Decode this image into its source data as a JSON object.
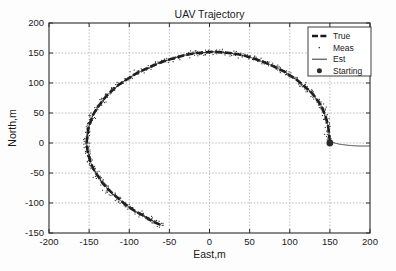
{
  "chart_data": {
    "type": "line",
    "title": "UAV Trajectory",
    "xlabel": "East,m",
    "ylabel": "North,m",
    "xlim": [
      -200,
      200
    ],
    "ylim": [
      -150,
      200
    ],
    "xticks": [
      -200,
      -150,
      -100,
      -50,
      0,
      50,
      100,
      150,
      200
    ],
    "yticks": [
      -150,
      -100,
      -50,
      0,
      50,
      100,
      150,
      200
    ],
    "grid": true,
    "legend_position": "top-right",
    "legend": [
      {
        "name": "True",
        "style": "dashed-thick",
        "color": "#1a1a1a"
      },
      {
        "name": "Meas",
        "style": "dot-marker",
        "color": "#3a3a3a"
      },
      {
        "name": "Est",
        "style": "solid-thin",
        "color": "#1a1a1a"
      },
      {
        "name": "Starting",
        "style": "filled-circle",
        "color": "#2a2a2a"
      }
    ],
    "annotations": [
      {
        "label": "Starting",
        "x": 150,
        "y": 0
      }
    ],
    "series": [
      {
        "name": "True",
        "style": "dashed-thick",
        "comment": "Circular arc radius ~152 centered near (0,0); traversed counter-clockwise from (150,0) over the top, around the left side, then a descending tail to (-60,-137)",
        "points": [
          [
            150,
            2
          ],
          [
            149,
            14
          ],
          [
            148,
            26
          ],
          [
            146,
            38
          ],
          [
            143,
            50
          ],
          [
            139,
            62
          ],
          [
            134,
            72
          ],
          [
            129,
            81
          ],
          [
            123,
            89
          ],
          [
            116,
            97
          ],
          [
            109,
            105
          ],
          [
            101,
            112
          ],
          [
            93,
            119
          ],
          [
            84,
            125
          ],
          [
            75,
            131
          ],
          [
            65,
            136
          ],
          [
            55,
            141
          ],
          [
            45,
            145
          ],
          [
            35,
            148
          ],
          [
            25,
            150
          ],
          [
            15,
            151
          ],
          [
            5,
            152
          ],
          [
            -5,
            151
          ],
          [
            -15,
            150
          ],
          [
            -25,
            148
          ],
          [
            -35,
            145
          ],
          [
            -45,
            141
          ],
          [
            -55,
            137
          ],
          [
            -65,
            132
          ],
          [
            -75,
            126
          ],
          [
            -85,
            120
          ],
          [
            -95,
            113
          ],
          [
            -104,
            105
          ],
          [
            -113,
            97
          ],
          [
            -121,
            88
          ],
          [
            -128,
            79
          ],
          [
            -134,
            69
          ],
          [
            -140,
            58
          ],
          [
            -145,
            47
          ],
          [
            -148,
            36
          ],
          [
            -151,
            24
          ],
          [
            -152,
            12
          ],
          [
            -153,
            0
          ],
          [
            -152,
            -12
          ],
          [
            -150,
            -24
          ],
          [
            -147,
            -36
          ],
          [
            -143,
            -47
          ],
          [
            -138,
            -57
          ],
          [
            -133,
            -67
          ],
          [
            -127,
            -76
          ],
          [
            -120,
            -85
          ],
          [
            -113,
            -93
          ],
          [
            -106,
            -101
          ],
          [
            -99,
            -108
          ],
          [
            -92,
            -114
          ],
          [
            -85,
            -119
          ],
          [
            -79,
            -124
          ],
          [
            -73,
            -129
          ],
          [
            -67,
            -133
          ],
          [
            -60,
            -137
          ]
        ]
      },
      {
        "name": "Est",
        "style": "solid-thin",
        "comment": "Estimated track overlays the true arc, then diverges to the right of the starting point toward (200,-5)",
        "points": [
          [
            150,
            2
          ],
          [
            156,
            0
          ],
          [
            162,
            -2
          ],
          [
            168,
            -3
          ],
          [
            174,
            -4
          ],
          [
            180,
            -4.5
          ],
          [
            186,
            -5
          ],
          [
            193,
            -5
          ],
          [
            200,
            -5
          ]
        ]
      },
      {
        "name": "Meas",
        "style": "dot-marker",
        "comment": "Noisy measurements scattered +/- 4 m about the True arc along its whole length",
        "noise_sigma": 4
      }
    ]
  },
  "axes": {
    "x_tick_labels": [
      "-200",
      "-150",
      "-100",
      "-50",
      "0",
      "50",
      "100",
      "150",
      "200"
    ],
    "y_tick_labels": [
      "200",
      "150",
      "100",
      "50",
      "0",
      "-50",
      "-100",
      "-150"
    ]
  }
}
